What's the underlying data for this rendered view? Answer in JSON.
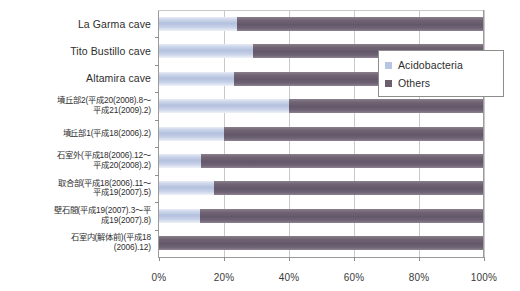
{
  "chart_data": {
    "type": "bar",
    "orientation": "horizontal",
    "stacked": true,
    "normalized_percent": true,
    "title": "",
    "xlabel": "",
    "ylabel": "",
    "xlim": [
      0,
      100
    ],
    "xticks": [
      0,
      20,
      40,
      60,
      80,
      100
    ],
    "xticklabels": [
      "0%",
      "20%",
      "40%",
      "60%",
      "80%",
      "100%"
    ],
    "grid": "vertical",
    "legend_position": "upper-right-inside",
    "categories": [
      "La Garma cave",
      "Tito Bustillo cave",
      "Altamira cave",
      "墳丘部2(平成20(2008).8〜平成21(2009).2)",
      "墳丘部1(平成18(2006).2)",
      "石室外(平成18(2006).12〜平成20(2008).2)",
      "取合部(平成18(2006).11〜平成19(2007).5)",
      "壁石間(平成19(2007).3〜平成19(2007).8)",
      "石室内(解体前)(平成18(2006).12)"
    ],
    "category_lines": [
      [
        "La Garma cave"
      ],
      [
        "Tito Bustillo cave"
      ],
      [
        "Altamira cave"
      ],
      [
        "墳丘部2(平成20(2008).8〜",
        "平成21(2009).2)"
      ],
      [
        "墳丘部1(平成18(2006).2)"
      ],
      [
        "石室外(平成18(2006).12〜",
        "平成20(2008).2)"
      ],
      [
        "取合部(平成18(2006).11〜",
        "平成19(2007).5)"
      ],
      [
        "壁石間(平成19(2007).3〜平",
        "成19(2007).8)"
      ],
      [
        "石室内(解体前)(平成18",
        "(2006).12)"
      ]
    ],
    "series": [
      {
        "name": "Acidobacteria",
        "color": "#b9c6e1",
        "values": [
          24,
          29,
          23,
          40,
          20,
          13,
          17,
          12.5,
          0
        ]
      },
      {
        "name": "Others",
        "color": "#6b5f6e",
        "values": [
          76,
          71,
          77,
          60,
          80,
          87,
          83,
          87.5,
          100
        ]
      }
    ]
  },
  "legend": {
    "items": [
      {
        "label": "Acidobacteria",
        "color": "#b9c6e1"
      },
      {
        "label": "Others",
        "color": "#6b5f6e"
      }
    ]
  }
}
